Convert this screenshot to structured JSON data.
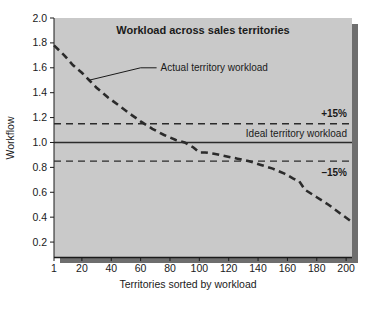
{
  "chart_data": {
    "type": "line",
    "title": "Workload across sales territories",
    "xlabel": "Territories sorted by workload",
    "ylabel": "Workflow",
    "xlim": [
      1,
      204
    ],
    "ylim": [
      0.08,
      2.0
    ],
    "grid": false,
    "legend_position": "inline-annotations",
    "xticks": [
      "1",
      "20",
      "40",
      "60",
      "80",
      "100",
      "120",
      "140",
      "160",
      "180",
      "200"
    ],
    "xtick_values": [
      1,
      20,
      40,
      60,
      80,
      100,
      120,
      140,
      160,
      180,
      200
    ],
    "yticks": [
      "0.2",
      "0.4",
      "0.6",
      "0.8",
      "1.0",
      "1.2",
      "1.4",
      "1.6",
      "1.8",
      "2.0"
    ],
    "ytick_values": [
      0.2,
      0.4,
      0.6,
      0.8,
      1.0,
      1.2,
      1.4,
      1.6,
      1.8,
      2.0
    ],
    "series": [
      {
        "name": "Actual territory workload",
        "style": "dashed",
        "color": "#2b2b2b",
        "x": [
          1,
          8,
          14,
          20,
          25,
          30,
          38,
          46,
          54,
          60,
          68,
          76,
          84,
          90,
          96,
          100,
          104,
          110,
          118,
          126,
          134,
          142,
          150,
          158,
          164,
          168,
          172,
          180,
          188,
          196,
          203
        ],
        "y": [
          1.78,
          1.7,
          1.62,
          1.56,
          1.5,
          1.44,
          1.36,
          1.29,
          1.22,
          1.17,
          1.11,
          1.06,
          1.02,
          1.0,
          0.96,
          0.92,
          0.92,
          0.91,
          0.89,
          0.87,
          0.85,
          0.82,
          0.79,
          0.75,
          0.71,
          0.69,
          0.62,
          0.56,
          0.5,
          0.43,
          0.37
        ]
      }
    ],
    "reference_lines": [
      {
        "name": "upper-tolerance",
        "label": "+15%",
        "value": 1.15,
        "style": "dashed",
        "color": "#2b2b2b"
      },
      {
        "name": "ideal",
        "label": "Ideal territory workload",
        "value": 1.0,
        "style": "solid",
        "color": "#2b2b2b"
      },
      {
        "name": "lower-tolerance",
        "label": "–15%",
        "value": 0.85,
        "style": "dashed",
        "color": "#2b2b2b"
      }
    ],
    "annotations": [
      {
        "name": "actual-workload-callout",
        "text": "Actual territory workload",
        "leader_from": [
          25,
          1.5
        ],
        "leader_to": [
          60,
          1.6
        ]
      }
    ],
    "colors": {
      "plot_background": "#c9c9c9",
      "shadow": "#6e6e6e",
      "page_background": "#ffffff",
      "ink": "#1a1a1a"
    }
  }
}
